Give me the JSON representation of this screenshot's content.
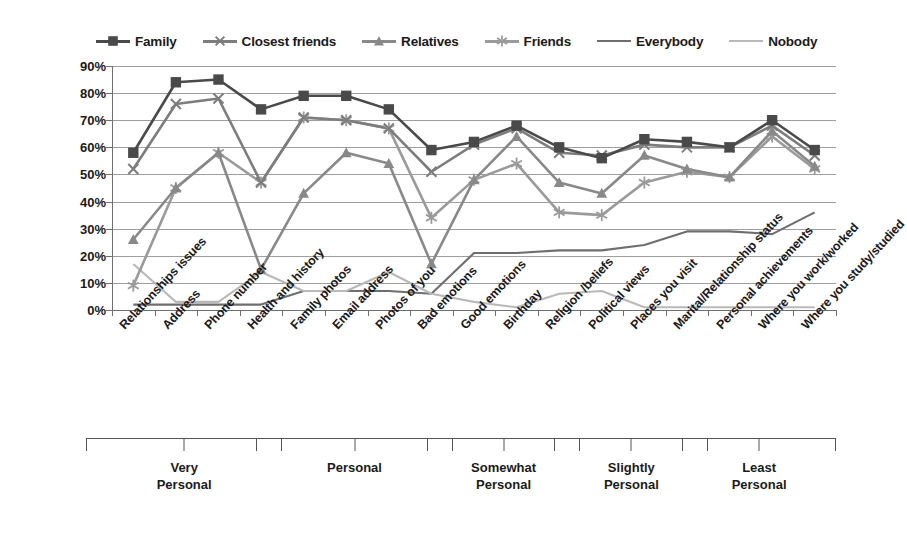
{
  "chart_data": {
    "type": "line",
    "title": "",
    "xlabel": "",
    "ylabel": "",
    "ylim": [
      0,
      90
    ],
    "ytick_labels": [
      "0%",
      "10%",
      "20%",
      "30%",
      "40%",
      "50%",
      "60%",
      "70%",
      "80%",
      "90%"
    ],
    "ytick_values": [
      0,
      10,
      20,
      30,
      40,
      50,
      60,
      70,
      80,
      90
    ],
    "grid": true,
    "legend_position": "top",
    "categories": [
      "Relationships issues",
      "Address",
      "Phone number",
      "Health and history",
      "Family photos",
      "Email address",
      "Photos of you",
      "Bad emotions",
      "Good emotions",
      "Birthday",
      "Religion /beliefs",
      "Political views",
      "Places you visit",
      "Marital/Relationship status",
      "Personal achievements",
      "Where you work/worked",
      "Where you study/studied"
    ],
    "series": [
      {
        "name": "Family",
        "marker": "square",
        "color": "#4a4a4a",
        "values": [
          58,
          84,
          85,
          74,
          79,
          79,
          74,
          59,
          62,
          68,
          60,
          56,
          63,
          62,
          60,
          70,
          59
        ]
      },
      {
        "name": "Closest friends",
        "marker": "x",
        "color": "#7d7d7d",
        "values": [
          52,
          76,
          78,
          47,
          71,
          70,
          67,
          51,
          61,
          67,
          58,
          57,
          61,
          60,
          60,
          68,
          57
        ]
      },
      {
        "name": "Relatives",
        "marker": "triangle",
        "color": "#898989",
        "values": [
          26,
          45,
          58,
          15,
          43,
          58,
          54,
          17,
          48,
          64,
          47,
          43,
          57,
          52,
          49,
          66,
          53
        ]
      },
      {
        "name": "Friends",
        "marker": "star",
        "color": "#9a9a9a",
        "values": [
          9,
          45,
          58,
          47,
          71,
          70,
          67,
          34,
          48,
          54,
          36,
          35,
          47,
          51,
          49,
          64,
          52
        ]
      },
      {
        "name": "Everybody",
        "marker": "none",
        "color": "#6e6e6e",
        "values": [
          2,
          2,
          2,
          2,
          7,
          7,
          7,
          6,
          21,
          21,
          22,
          22,
          24,
          29,
          29,
          28,
          36
        ]
      },
      {
        "name": "Nobody",
        "marker": "none",
        "color": "#b9b9b9",
        "values": [
          17,
          3,
          3,
          14,
          7,
          7,
          14,
          6,
          3,
          1,
          6,
          7,
          1,
          1,
          1,
          1,
          1
        ]
      }
    ],
    "groups": [
      {
        "label": "Very\nPersonal",
        "start": 0,
        "end": 3
      },
      {
        "label": "Personal",
        "start": 4,
        "end": 7
      },
      {
        "label": "Somewhat\nPersonal",
        "start": 8,
        "end": 10
      },
      {
        "label": "Slightly\nPersonal",
        "start": 11,
        "end": 13
      },
      {
        "label": "Least\nPersonal",
        "start": 14,
        "end": 16
      }
    ]
  }
}
